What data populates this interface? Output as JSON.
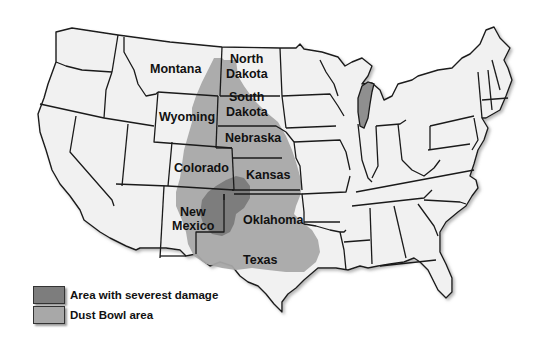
{
  "map": {
    "title": "Dust Bowl region of the United States",
    "colors": {
      "state_fill": "#f1f1f1",
      "border": "#1a1a1a",
      "dust_bowl": "#a8a8a8",
      "severe": "#7d7d7d",
      "background": "#ffffff"
    },
    "labels": {
      "montana": "Montana",
      "north_dakota_1": "North",
      "north_dakota_2": "Dakota",
      "south_dakota_1": "South",
      "south_dakota_2": "Dakota",
      "wyoming": "Wyoming",
      "nebraska": "Nebraska",
      "colorado": "Colorado",
      "kansas": "Kansas",
      "new_mexico_1": "New",
      "new_mexico_2": "Mexico",
      "oklahoma": "Oklahoma",
      "texas": "Texas"
    }
  },
  "legend": {
    "items": [
      {
        "label": "Area with severest damage",
        "color": "#7d7d7d"
      },
      {
        "label": "Dust Bowl area",
        "color": "#a8a8a8"
      }
    ]
  }
}
